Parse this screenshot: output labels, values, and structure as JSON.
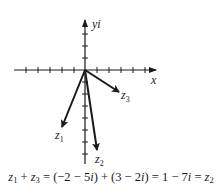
{
  "diagram": {
    "type": "complex-plane-vector-addition",
    "axes": {
      "x_label": "x",
      "y_label": "yi",
      "origin_px": [
        85,
        70
      ],
      "unit_px": 11.5,
      "x_ticks": [
        -5,
        -4,
        -3,
        -2,
        -1,
        1,
        2,
        3,
        4,
        5
      ],
      "y_ticks": [
        3,
        2,
        1,
        -1,
        -2,
        -3,
        -4,
        -5,
        -6,
        -7
      ]
    },
    "vectors": [
      {
        "name": "z1",
        "label_main": "z",
        "label_sub": "1",
        "re": -2,
        "im": -5
      },
      {
        "name": "z2",
        "label_main": "z",
        "label_sub": "2",
        "re": 1,
        "im": -7
      },
      {
        "name": "z3",
        "label_main": "z",
        "label_sub": "3",
        "re": 3,
        "im": -2
      }
    ],
    "color": "#1a1a1a"
  },
  "caption": {
    "lhs_a": "z",
    "lhs_a_sub": "1",
    "plus": " + ",
    "lhs_b": "z",
    "lhs_b_sub": "3",
    "eq1": " = (−2 − 5",
    "i1": "i",
    "mid": ") + (3 − 2",
    "i2": "i",
    "mid2": ") = 1 − 7",
    "i3": "i",
    "eq2": " = ",
    "rhs": "z",
    "rhs_sub": "2"
  }
}
